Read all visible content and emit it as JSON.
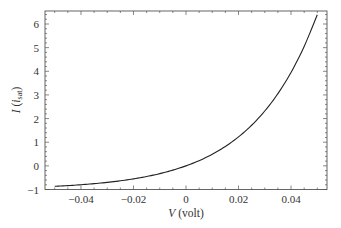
{
  "chart_data": {
    "type": "line",
    "title": "",
    "xlabel": "V (volt)",
    "xlabel_var": "V",
    "xlabel_unit": " (volt)",
    "ylabel": "I (i_sat)",
    "ylabel_var": "I",
    "ylabel_sub_base": "i",
    "ylabel_sub": "sat",
    "xlim": [
      -0.0537,
      0.0537
    ],
    "ylim": [
      -1.0,
      6.55
    ],
    "xticks": [
      -0.04,
      -0.02,
      0,
      0.02,
      0.04
    ],
    "xtick_labels": [
      "−0.04",
      "−0.02",
      "0",
      "0.02",
      "0.04"
    ],
    "yticks": [
      -1,
      0,
      1,
      2,
      3,
      4,
      5,
      6
    ],
    "ytick_labels": [
      "−1",
      "0",
      "1",
      "2",
      "3",
      "4",
      "5",
      "6"
    ],
    "grid": false,
    "legend": null,
    "series": [
      {
        "name": "I = exp(V/0.025) - 1",
        "color": "#222222",
        "x": [
          -0.05,
          -0.045,
          -0.04,
          -0.035,
          -0.03,
          -0.025,
          -0.02,
          -0.015,
          -0.01,
          -0.005,
          0,
          0.005,
          0.01,
          0.015,
          0.02,
          0.025,
          0.03,
          0.035,
          0.04,
          0.045,
          0.05
        ],
        "values": [
          -0.865,
          -0.835,
          -0.798,
          -0.753,
          -0.699,
          -0.632,
          -0.551,
          -0.451,
          -0.33,
          -0.181,
          0.0,
          0.221,
          0.492,
          0.822,
          1.226,
          1.718,
          2.32,
          3.055,
          3.953,
          5.05,
          6.389
        ]
      }
    ]
  },
  "colors": {
    "frame": "#555555",
    "line": "#222222",
    "text": "#333333"
  }
}
